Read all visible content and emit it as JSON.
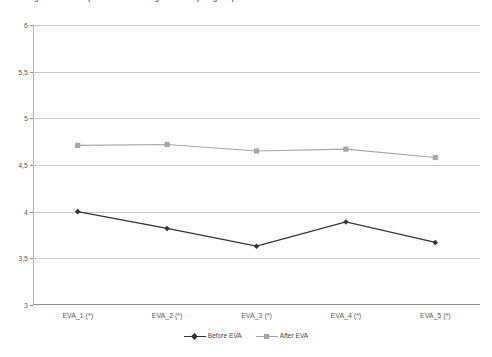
{
  "chart_title": "Figure 5 – Comparison of average scores per group before and after the EVA",
  "legend": {
    "position": "bottom-center",
    "entries": [
      {
        "label": "Before EVA",
        "color": "#333333",
        "marker": "diamond-marker-icon"
      },
      {
        "label": "After EVA",
        "color": "#a6a6a6",
        "marker": "square-marker-icon"
      }
    ]
  },
  "axes": {
    "y_ticks": [
      "3",
      "3,5",
      "4",
      "4,5",
      "5",
      "5,5",
      "6"
    ],
    "x_ticks": [
      "EVA_1 (*)",
      "EVA_2 (*)",
      "EVA_3 (*)",
      "EVA_4 (*)",
      "EVA_5 (*)"
    ]
  },
  "chart_data": {
    "type": "line",
    "title": "Figure 5 – Comparison of average scores per group before and after the EVA",
    "xlabel": "",
    "ylabel": "",
    "categories": [
      "EVA_1 (*)",
      "EVA_2 (*)",
      "EVA_3 (*)",
      "EVA_4 (*)",
      "EVA_5 (*)"
    ],
    "series": [
      {
        "name": "Before EVA",
        "color": "#333333",
        "marker": "diamond",
        "values": [
          4.0,
          3.82,
          3.63,
          3.89,
          3.67
        ]
      },
      {
        "name": "After EVA",
        "color": "#a6a6a6",
        "marker": "square",
        "values": [
          4.71,
          4.72,
          4.65,
          4.67,
          4.58
        ]
      }
    ],
    "ylim": [
      3,
      6
    ],
    "ytick_step": 0.5,
    "ytick_labels": [
      "3",
      "3,5",
      "4",
      "4,5",
      "5",
      "5,5",
      "6"
    ],
    "grid": {
      "horizontal": true,
      "vertical": false,
      "color": "#c9c9c9"
    },
    "legend_position": "bottom-center",
    "decimal_separator": ","
  }
}
